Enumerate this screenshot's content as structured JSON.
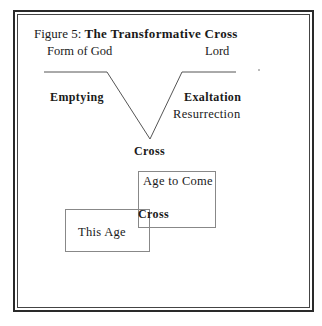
{
  "figure": {
    "title_prefix": "Figure 5: ",
    "title_bold": "The Transformative Cross"
  },
  "diagram": {
    "top_left_label": "Form of God",
    "top_right_label": "Lord",
    "left_arm_label": "Emptying",
    "right_arm_label": "Exaltation",
    "right_arm_sublabel": "Resurrection",
    "vertex_label": "Cross",
    "boxes": {
      "age_to_come": "Age to Come",
      "this_age": "This Age",
      "overlap_label": "Cross"
    }
  },
  "colors": {
    "line": "#555555",
    "box_border": "#888888",
    "text": "#1a1a1a"
  }
}
